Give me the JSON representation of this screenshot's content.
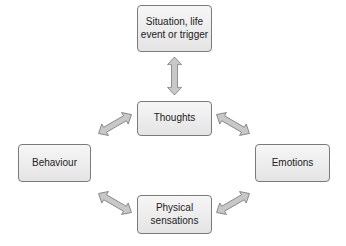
{
  "diagram": {
    "type": "cognitive-model",
    "nodes": {
      "trigger": "Situation, life event or trigger",
      "thoughts": "Thoughts",
      "behaviour": "Behaviour",
      "emotions": "Emotions",
      "physical": "Physical sensations"
    },
    "edges": [
      {
        "from": "trigger",
        "to": "thoughts",
        "direction": "both"
      },
      {
        "from": "thoughts",
        "to": "behaviour",
        "direction": "both"
      },
      {
        "from": "thoughts",
        "to": "emotions",
        "direction": "both"
      },
      {
        "from": "behaviour",
        "to": "physical",
        "direction": "both"
      },
      {
        "from": "emotions",
        "to": "physical",
        "direction": "both"
      }
    ],
    "colors": {
      "box_fill": "#ececec",
      "box_border": "#7a7a7a",
      "arrow_fill": "#c8c8c8",
      "arrow_stroke": "#7a7a7a"
    }
  }
}
